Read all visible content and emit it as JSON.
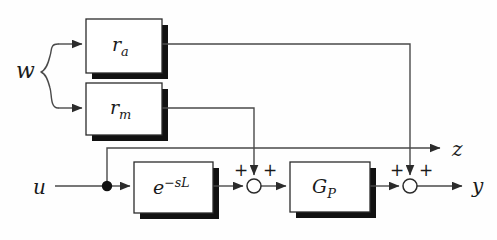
{
  "figure": {
    "type": "control-block-diagram",
    "background_color": "#fefefe",
    "line_color": "#4a4a4a",
    "ink_color": "#1a1a1a",
    "shadow_color": "#111111",
    "width": 497,
    "height": 240
  },
  "blocks": [
    {
      "id": "ra",
      "name": "additive-disturbance-block",
      "label_main": "r",
      "label_sub": "a",
      "x": 86,
      "y": 19,
      "w": 76,
      "h": 54
    },
    {
      "id": "rm",
      "name": "multiplicative-disturbance-block",
      "label_main": "r",
      "label_sub": "m",
      "x": 86,
      "y": 83,
      "w": 76,
      "h": 52
    },
    {
      "id": "delay",
      "name": "time-delay-block",
      "label_main": "e",
      "label_sup": "−sL",
      "x": 134,
      "y": 162,
      "w": 79,
      "h": 51
    },
    {
      "id": "gp",
      "name": "plant-transfer-function-block",
      "label_main": "G",
      "label_sub": "P",
      "x": 290,
      "y": 162,
      "w": 80,
      "h": 50
    }
  ],
  "signals": {
    "input_u": "u",
    "disturbance_w": "w",
    "output_z": "z",
    "output_y": "y"
  },
  "junctions": [
    {
      "id": "sum1",
      "name": "first-summing-junction",
      "cx": 254,
      "cy": 186,
      "r": 7,
      "signs": [
        "+",
        "+"
      ]
    },
    {
      "id": "sum2",
      "name": "second-summing-junction",
      "cx": 410,
      "cy": 186,
      "r": 7,
      "signs": [
        "+",
        "+"
      ]
    }
  ],
  "nodes": [
    {
      "id": "branch-u",
      "name": "input-branch-dot",
      "cx": 107,
      "cy": 186,
      "r": 5
    }
  ]
}
